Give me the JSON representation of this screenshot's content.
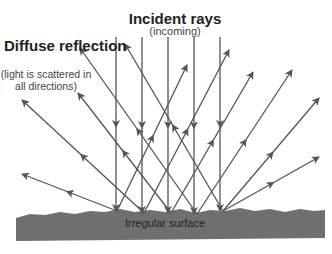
{
  "diagram": {
    "title": "Incident rays",
    "title_sub": "(incoming)",
    "diffuse_title": "Diffuse reflection",
    "diffuse_sub": "(light is scattered in all directions)",
    "surface_label": "Irregular surface",
    "colors": {
      "ray": "#555555",
      "surface": "#6f6f6f",
      "text": "#222222"
    },
    "incident_rays": [
      {
        "x": 116,
        "y1": 37,
        "y2": 211
      },
      {
        "x": 142,
        "y1": 37,
        "y2": 213
      },
      {
        "x": 168,
        "y1": 37,
        "y2": 213
      },
      {
        "x": 194,
        "y1": 37,
        "y2": 214
      },
      {
        "x": 220,
        "y1": 37,
        "y2": 211
      }
    ],
    "reflected_rays": [
      {
        "from": [
          117,
          211
        ],
        "to": [
          22,
          174
        ]
      },
      {
        "from": [
          144,
          213
        ],
        "to": [
          22,
          100
        ]
      },
      {
        "from": [
          171,
          213
        ],
        "to": [
          78,
          93
        ]
      },
      {
        "from": [
          197,
          214
        ],
        "to": [
          80,
          48
        ]
      },
      {
        "from": [
          223,
          211
        ],
        "to": [
          125,
          44
        ]
      },
      {
        "from": [
          117,
          211
        ],
        "to": [
          187,
          65
        ]
      },
      {
        "from": [
          144,
          213
        ],
        "to": [
          229,
          50
        ]
      },
      {
        "from": [
          171,
          213
        ],
        "to": [
          253,
          72
        ]
      },
      {
        "from": [
          197,
          214
        ],
        "to": [
          292,
          70
        ]
      },
      {
        "from": [
          223,
          211
        ],
        "to": [
          319,
          98
        ]
      },
      {
        "from": [
          223,
          211
        ],
        "to": [
          319,
          157
        ]
      }
    ]
  }
}
